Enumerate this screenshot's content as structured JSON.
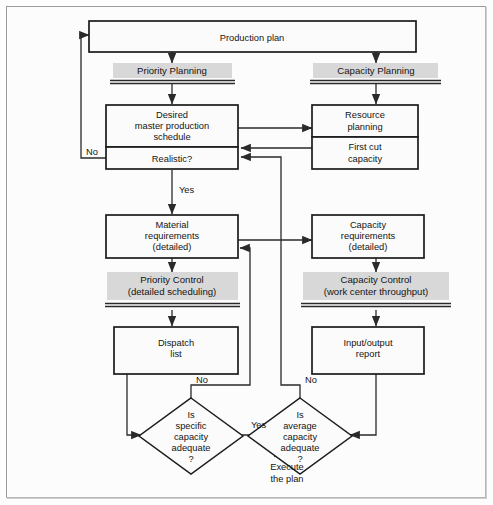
{
  "diagram": {
    "colors": {
      "band_fill": "#d8d8d8",
      "box_stroke": "#1b1b1b",
      "box_fill": "#fbfbfb",
      "line": "#2a2a2a",
      "frame_border": "#9b9b9b",
      "page_background": "#fcfcfc"
    },
    "nodes": {
      "production_plan": {
        "label": "Production plan"
      },
      "priority_planning": {
        "label": "Priority Planning"
      },
      "capacity_planning": {
        "label": "Capacity Planning"
      },
      "desired_mps": {
        "line1": "Desired",
        "line2": "master production",
        "line3": "schedule"
      },
      "realistic": {
        "label": "Realistic?"
      },
      "resource_planning": {
        "line1": "Resource",
        "line2": "planning"
      },
      "first_cut_capacity": {
        "line1": "First cut",
        "line2": "capacity"
      },
      "material_requirements": {
        "line1": "Material",
        "line2": "requirements",
        "line3": "(detailed)"
      },
      "capacity_requirements": {
        "line1": "Capacity",
        "line2": "requirements",
        "line3": "(detailed)"
      },
      "priority_control": {
        "line1": "Priority Control",
        "line2": "(detailed scheduling)"
      },
      "capacity_control": {
        "line1": "Capacity Control",
        "line2": "(work center throughput)"
      },
      "dispatch_list": {
        "line1": "Dispatch",
        "line2": "list"
      },
      "input_output_report": {
        "line1": "Input/output",
        "line2": "report"
      },
      "specific_capacity_decision": {
        "line1": "Is",
        "line2": "specific",
        "line3": "capacity",
        "line4": "adequate",
        "line5": "?"
      },
      "average_capacity_decision": {
        "line1": "Is",
        "line2": "average",
        "line3": "capacity",
        "line4": "adequate",
        "line5": "?"
      },
      "execute_plan": {
        "line1": "Execute",
        "line2": "the plan"
      }
    },
    "edge_labels": {
      "no_realistic": "No",
      "yes_realistic": "Yes",
      "no_specific": "No",
      "no_average": "No",
      "yes_specific": "Yes"
    }
  }
}
